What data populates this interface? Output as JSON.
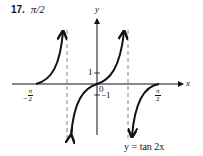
{
  "problem": {
    "number": "17.",
    "answer": "π/2"
  },
  "graph": {
    "x_axis_label": "x",
    "y_axis_label": "y",
    "tick_labels": {
      "neg_pi_over_2": {
        "sign": "−",
        "num": "π",
        "den": "2"
      },
      "pi_over_2": {
        "num": "π",
        "den": "2"
      },
      "one": "1",
      "zero": "0",
      "neg_one": "−1"
    },
    "caption": "y = tan 2x",
    "asymptotes": [
      "-π/4",
      "π/4"
    ],
    "colors": {
      "curve": "#111111",
      "axis": "#111111",
      "asymptote": "#666666"
    }
  }
}
